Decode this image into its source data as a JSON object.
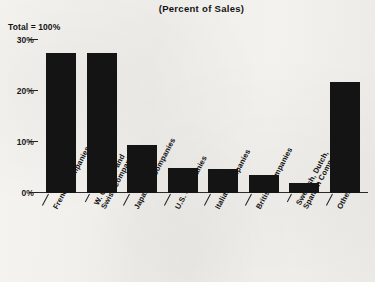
{
  "chart_data": {
    "type": "bar",
    "title": "(Percent of Sales)",
    "subtitle": "",
    "annotation": "Total = 100%",
    "xlabel": "",
    "ylabel": "",
    "ylim": [
      0,
      30
    ],
    "ytick_labels": [
      "0%",
      "10%",
      "20%",
      "30%"
    ],
    "ytick_values": [
      0,
      10,
      20,
      30
    ],
    "grid": false,
    "legend": null,
    "categories": [
      "French Companies",
      "W. German and Swiss Companies",
      "Japanese Companies",
      "U.S. Companies",
      "Italian Companies",
      "British Companies",
      "Swedish, Dutch, Spanish Companies",
      "Other"
    ],
    "category_lines": [
      [
        "French Companies"
      ],
      [
        "W. German and",
        "Swiss Companies"
      ],
      [
        "Japanese Companies"
      ],
      [
        "U.S. Companies"
      ],
      [
        "Italian Companies"
      ],
      [
        "British Companies"
      ],
      [
        "Swedish, Dutch,",
        "Spanish Companies"
      ],
      [
        "Other"
      ]
    ],
    "values": [
      27.5,
      27.5,
      9.5,
      5.0,
      4.8,
      3.5,
      2.0,
      21.7
    ],
    "bar_color": "#141414",
    "background_color": "#f2f1ee",
    "axis_color": "#2a2a2a"
  }
}
